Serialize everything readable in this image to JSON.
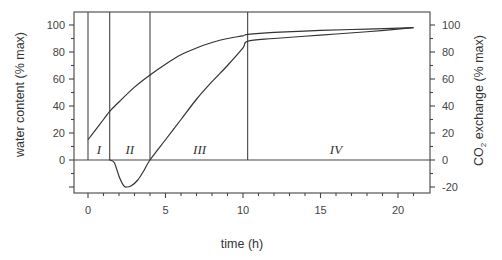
{
  "chart_data": {
    "type": "line",
    "title": "",
    "xlabel": "time (h)",
    "ylabel": "water content (% max)",
    "ylabel_right": "CO2 exchange (% max)",
    "xlim": [
      -0.6,
      22
    ],
    "ylim": [
      -25,
      108
    ],
    "x_ticks": [
      0,
      5,
      10,
      15,
      20
    ],
    "y_ticks_left": [
      0,
      20,
      40,
      60,
      80,
      100
    ],
    "y_ticks_right": [
      -20,
      0,
      20,
      40,
      60,
      80,
      100
    ],
    "grid": false,
    "phase_boundaries_h": [
      0,
      1.4,
      4.0,
      10.3
    ],
    "phases": [
      {
        "label": "I",
        "x": 0.7
      },
      {
        "label": "II",
        "x": 2.7
      },
      {
        "label": "III",
        "x": 7.2
      },
      {
        "label": "IV",
        "x": 16
      }
    ],
    "series": [
      {
        "name": "water content",
        "axis": "left",
        "x": [
          0,
          1,
          1.4,
          2,
          3,
          4,
          5,
          6,
          7,
          8,
          9,
          10,
          10.3,
          12,
          15,
          18,
          21
        ],
        "y": [
          15,
          30,
          36,
          43,
          54,
          63,
          71,
          78,
          83,
          87,
          90,
          92,
          93,
          94.5,
          96,
          97,
          98
        ]
      },
      {
        "name": "CO2 exchange",
        "axis": "right",
        "x": [
          1.4,
          1.7,
          2.0,
          2.3,
          2.5,
          2.8,
          3.2,
          3.6,
          4.0,
          5,
          6,
          7,
          8,
          9,
          10,
          10.3,
          12,
          15,
          18,
          21
        ],
        "y": [
          0,
          -2,
          -12,
          -19,
          -20,
          -19,
          -15,
          -8,
          0,
          15,
          30,
          45,
          58,
          70,
          83,
          88,
          90,
          92.5,
          95,
          98
        ]
      }
    ]
  },
  "labels": {
    "x_axis": "time (h)",
    "y_left": "water content (% max)",
    "y_right_prefix": "CO",
    "y_right_sub": "2",
    "y_right_suffix": " exchange (% max)"
  }
}
